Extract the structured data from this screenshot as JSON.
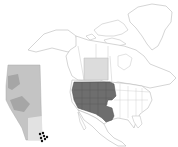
{
  "figure": {
    "type": "species-distribution-map",
    "panels": [
      {
        "id": "alberta-inset",
        "label": "Alberta (inset)",
        "features": [
          "elevation shading",
          "occurrence records"
        ]
      },
      {
        "id": "north-america",
        "label": "North America",
        "features": [
          "native range",
          "provincial highlight"
        ]
      }
    ]
  },
  "colors": {
    "background": "#ffffff",
    "outline": "#b8b8b8",
    "land": "#ffffff",
    "range_fill": "#6e6e6e",
    "range_border": "#4a4a4a",
    "province_highlight": "#dcdcdc",
    "inset_base": "#c4c4c4",
    "inset_dark": "#a6a6a6",
    "inset_light": "#e2e2e2",
    "occurrence_dot": "#111111"
  },
  "occurrences": [
    {
      "x": 40,
      "y": 134
    },
    {
      "x": 43,
      "y": 133
    },
    {
      "x": 44,
      "y": 136
    },
    {
      "x": 41,
      "y": 138
    },
    {
      "x": 45,
      "y": 139
    },
    {
      "x": 47,
      "y": 137
    },
    {
      "x": 42,
      "y": 141
    }
  ]
}
